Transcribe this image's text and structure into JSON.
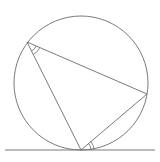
{
  "diagram": {
    "stroke_color": "#6b6b6b",
    "background": "#ffffff",
    "circle": {
      "cx": 81,
      "cy": 83,
      "r": 67
    },
    "vertices": {
      "A": {
        "x": 27,
        "y": 42
      },
      "B": {
        "x": 147,
        "y": 94
      },
      "C": {
        "x": 81,
        "y": 150
      }
    },
    "tangent_line": {
      "x1": 5,
      "y1": 150,
      "x2": 155,
      "y2": 150
    },
    "angle_marks": [
      {
        "at": "A",
        "between": [
          "C",
          "B"
        ],
        "type": "double-arc"
      },
      {
        "at": "C",
        "between": [
          "B",
          "tangent-right"
        ],
        "type": "double-arc"
      }
    ]
  }
}
